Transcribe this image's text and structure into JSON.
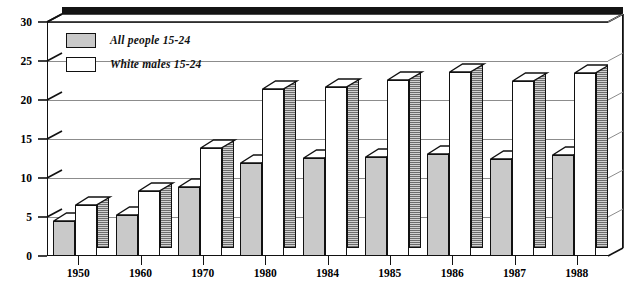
{
  "chart_data": {
    "type": "bar",
    "title": "",
    "subtitle": "",
    "xlabel": "",
    "ylabel": "",
    "categories": [
      "1950",
      "1960",
      "1970",
      "1980",
      "1984",
      "1985",
      "1986",
      "1987",
      "1988"
    ],
    "series": [
      {
        "name": "All people 15-24",
        "color": "#c9c9c9",
        "values": [
          4.5,
          5.2,
          8.8,
          11.9,
          12.6,
          12.7,
          13.1,
          12.5,
          13.0
        ]
      },
      {
        "name": "White males 15-24",
        "color": "#ffffff",
        "values": [
          6.5,
          8.3,
          13.8,
          21.4,
          21.7,
          22.6,
          23.6,
          22.5,
          23.5
        ]
      }
    ],
    "ylim": [
      0,
      30
    ],
    "yticks": [
      0,
      5,
      10,
      15,
      20,
      25,
      30
    ],
    "ytick_labels": [
      "0",
      "5",
      "10",
      "15",
      "20",
      "25",
      "30"
    ],
    "grid": true,
    "grid_axis": "y",
    "legend_position": "top-left",
    "style": "3d-bar"
  },
  "legend": {
    "items": [
      {
        "label": "All people 15-24",
        "swatch": "gray"
      },
      {
        "label": "White males 15-24",
        "swatch": "white"
      }
    ]
  }
}
